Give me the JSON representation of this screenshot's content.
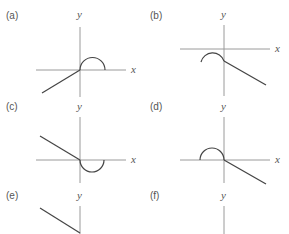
{
  "panels": [
    {
      "label": "(a)",
      "y_axis_label": "y",
      "x_axis_label": "x",
      "description": "ray from lower-left into origin, upper semicircle to the right of origin"
    },
    {
      "label": "(b)",
      "y_axis_label": "y",
      "x_axis_label": "x",
      "description": "upper arc left of y-axis below x-axis, ray going lower-right"
    },
    {
      "label": "(c)",
      "y_axis_label": "y",
      "x_axis_label": "x",
      "description": "ray from upper-left into origin, lower semicircle to the right"
    },
    {
      "label": "(d)",
      "y_axis_label": "y",
      "x_axis_label": "x",
      "description": "upper semicircle left of origin, ray going lower-right"
    },
    {
      "label": "(e)",
      "y_axis_label": "y",
      "x_axis_label": "",
      "description": "ray from upper-left toward y-axis (cropped)"
    },
    {
      "label": "(f)",
      "y_axis_label": "y",
      "x_axis_label": "",
      "description": "y-axis only (cropped)"
    }
  ],
  "colors": {
    "axis": "#9a9a9a",
    "curve": "#444444",
    "text": "#555555"
  }
}
